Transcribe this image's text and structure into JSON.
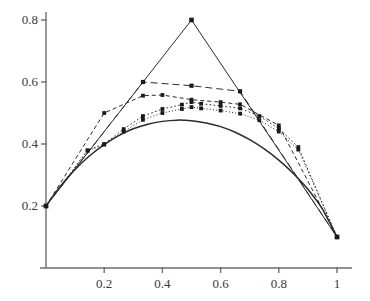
{
  "chart_data": {
    "type": "line",
    "title": "",
    "subtitle": "",
    "xlabel": "",
    "ylabel": "",
    "xlim": [
      0,
      1
    ],
    "ylim": [
      0,
      0.85
    ],
    "grid": false,
    "legend": false,
    "legend_position": "none",
    "axis_style": "two-spine-origin-cross",
    "x_ticks": [
      0.2,
      0.4,
      0.6,
      0.8,
      1
    ],
    "x_tick_labels": [
      "0.2",
      "0.4",
      "0.6",
      "0.8",
      "1"
    ],
    "y_ticks": [
      0.2,
      0.4,
      0.6,
      0.8
    ],
    "y_tick_labels": [
      "0.2",
      "0.4",
      "0.6",
      "0.8"
    ],
    "marker": "square",
    "marker_color": "#1a1a1a",
    "line_color": "#2b2b2b",
    "axis_color": "#6e6e6e",
    "background_color": "#ffffff",
    "series": [
      {
        "name": "iteration-1",
        "style": "solid",
        "markers": true,
        "x": [
          0,
          0.5,
          1
        ],
        "y": [
          0.2,
          0.8,
          0.1
        ]
      },
      {
        "name": "iteration-2",
        "style": "dashed",
        "markers": true,
        "x": [
          0,
          0.3333,
          0.5,
          0.6667,
          1
        ],
        "y": [
          0.2,
          0.6,
          0.588,
          0.57,
          0.1
        ]
      },
      {
        "name": "iteration-3",
        "style": "dashed-short",
        "markers": true,
        "x": [
          0,
          0.2,
          0.3333,
          0.4,
          0.5,
          0.6,
          0.6667,
          0.8,
          1
        ],
        "y": [
          0.2,
          0.5,
          0.556,
          0.558,
          0.543,
          0.535,
          0.528,
          0.46,
          0.1
        ]
      },
      {
        "name": "iteration-4",
        "style": "dotted",
        "markers": true,
        "x": [
          0,
          0.143,
          0.2,
          0.267,
          0.333,
          0.4,
          0.467,
          0.5,
          0.533,
          0.6,
          0.667,
          0.733,
          0.8,
          0.867,
          1
        ],
        "y": [
          0.2,
          0.38,
          0.4,
          0.448,
          0.49,
          0.513,
          0.527,
          0.535,
          0.53,
          0.523,
          0.515,
          0.49,
          0.45,
          0.39,
          0.1
        ]
      },
      {
        "name": "iteration-5",
        "style": "dotted-fine",
        "markers": true,
        "x": [
          0,
          0.143,
          0.2,
          0.267,
          0.333,
          0.4,
          0.467,
          0.5,
          0.533,
          0.6,
          0.667,
          0.733,
          0.8,
          0.867,
          1
        ],
        "y": [
          0.2,
          0.378,
          0.398,
          0.44,
          0.478,
          0.5,
          0.513,
          0.519,
          0.515,
          0.508,
          0.498,
          0.477,
          0.44,
          0.382,
          0.1
        ]
      },
      {
        "name": "limit-curve",
        "style": "solid-smooth",
        "markers": false,
        "x": [
          0,
          0.05,
          0.1,
          0.15,
          0.2,
          0.25,
          0.3,
          0.35,
          0.4,
          0.45,
          0.5,
          0.55,
          0.6,
          0.65,
          0.7,
          0.75,
          0.8,
          0.85,
          0.9,
          0.95,
          1
        ],
        "y": [
          0.2,
          0.265,
          0.318,
          0.362,
          0.398,
          0.427,
          0.449,
          0.464,
          0.473,
          0.477,
          0.475,
          0.468,
          0.456,
          0.438,
          0.414,
          0.384,
          0.348,
          0.305,
          0.254,
          0.19,
          0.1
        ]
      }
    ],
    "endpoints": {
      "left": {
        "x": 0,
        "y": 0.2
      },
      "right": {
        "x": 1,
        "y": 0.1
      },
      "apex": {
        "x": 0.5,
        "y": 0.8
      }
    }
  }
}
